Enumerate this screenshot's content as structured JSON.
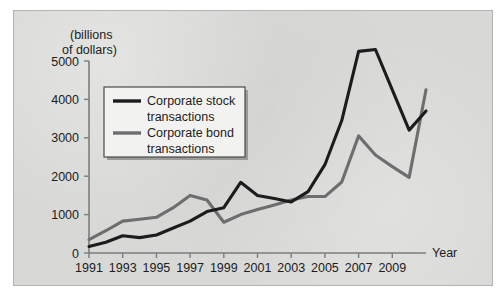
{
  "chart_data": {
    "type": "line",
    "title": "",
    "subtitle": "",
    "xlabel": "Year",
    "ylabel": "(billions of dollars)",
    "ylabel_line1": "(billions",
    "ylabel_line2": "of dollars)",
    "xlim": [
      1991,
      2011
    ],
    "ylim": [
      0,
      5000
    ],
    "grid": false,
    "legend_position": "upper-left-inside",
    "y_ticks": [
      0,
      1000,
      2000,
      3000,
      4000,
      5000
    ],
    "y_tick_labels": [
      "0",
      "1000",
      "2000",
      "3000",
      "4000",
      "5000"
    ],
    "x_ticks": [
      1991,
      1993,
      1995,
      1997,
      1999,
      2001,
      2003,
      2005,
      2007,
      2009
    ],
    "x_tick_labels": [
      "1991",
      "1993",
      "1995",
      "1997",
      "1999",
      "2001",
      "2003",
      "2005",
      "2007",
      "2009"
    ],
    "x": [
      1991,
      1992,
      1993,
      1994,
      1995,
      1996,
      1997,
      1998,
      1999,
      2000,
      2001,
      2002,
      2003,
      2004,
      2005,
      2006,
      2007,
      2008,
      2009,
      2010,
      2011
    ],
    "series": [
      {
        "name": "Corporate stock transactions",
        "legend_label_line1": "Corporate stock",
        "legend_label_line2": "transactions",
        "color": "#1c1c1c",
        "values": [
          170,
          280,
          450,
          400,
          470,
          650,
          830,
          1080,
          1180,
          1840,
          1500,
          1420,
          1330,
          1600,
          2300,
          3450,
          5250,
          5300,
          4250,
          3200,
          3700
        ]
      },
      {
        "name": "Corporate bond transactions",
        "legend_label_line1": "Corporate bond",
        "legend_label_line2": "transactions",
        "color": "#6e6e6e",
        "values": [
          350,
          580,
          830,
          880,
          930,
          1180,
          1500,
          1380,
          800,
          1000,
          1130,
          1250,
          1380,
          1470,
          1470,
          1850,
          3050,
          2550,
          2250,
          1970,
          4250
        ]
      }
    ]
  }
}
